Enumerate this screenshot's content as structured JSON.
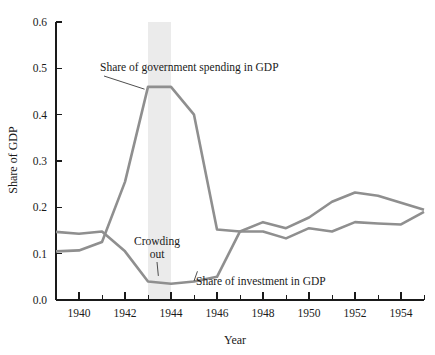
{
  "chart_data": {
    "type": "line",
    "title": "",
    "xlabel": "Year",
    "ylabel": "Share of GDP",
    "xlim": [
      1939,
      1955
    ],
    "ylim": [
      0.0,
      0.6
    ],
    "grid": false,
    "legend_position": "inline-annotations",
    "x": [
      1939,
      1940,
      1941,
      1942,
      1943,
      1944,
      1945,
      1946,
      1947,
      1948,
      1949,
      1950,
      1951,
      1952,
      1953,
      1954,
      1955
    ],
    "x_tick_labels_major": [
      "1940",
      "1942",
      "1944",
      "1946",
      "1948",
      "1950",
      "1952",
      "1954"
    ],
    "x_ticks_major": [
      1940,
      1942,
      1944,
      1946,
      1948,
      1950,
      1952,
      1954
    ],
    "x_ticks_minor": [
      1939,
      1941,
      1943,
      1945,
      1947,
      1949,
      1951,
      1953,
      1955
    ],
    "y_tick_labels": [
      "0.0",
      "0.1",
      "0.2",
      "0.3",
      "0.4",
      "0.5",
      "0.6"
    ],
    "y_ticks": [
      0.0,
      0.1,
      0.2,
      0.3,
      0.4,
      0.5,
      0.6
    ],
    "series": [
      {
        "name": "Share of government spending in GDP",
        "color": "#8f8f8f",
        "values": [
          0.105,
          0.107,
          0.125,
          0.255,
          0.46,
          0.46,
          0.4,
          0.152,
          0.148,
          0.168,
          0.155,
          0.178,
          0.212,
          0.232,
          0.225,
          0.21,
          0.195
        ]
      },
      {
        "name": "Share of investment in GDP",
        "color": "#8f8f8f",
        "values": [
          0.147,
          0.143,
          0.148,
          0.105,
          0.04,
          0.035,
          0.04,
          0.05,
          0.148,
          0.148,
          0.133,
          0.155,
          0.148,
          0.168,
          0.165,
          0.163,
          0.19
        ]
      }
    ],
    "shaded_band": {
      "label": "war peak highlight",
      "x_start": 1943,
      "x_end": 1944,
      "color": "#ebebeb"
    },
    "annotations": [
      {
        "id": "government-label",
        "text": "Share of government spending in GDP",
        "target_x": 1943,
        "target_y": 0.46
      },
      {
        "id": "crowding-out-label",
        "line1": "Crowding",
        "line2": "out",
        "target_x": 1943.5,
        "target_y": 0.04
      },
      {
        "id": "investment-label",
        "text": "Share of investment in GDP",
        "target_x": 1945.3,
        "target_y": 0.047
      }
    ]
  }
}
